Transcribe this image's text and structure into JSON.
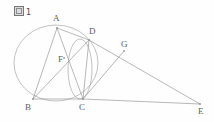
{
  "figure": {
    "caption_mark": "図",
    "caption_number": "1",
    "caption_full": "図 1"
  },
  "style": {
    "background": "#fefefe",
    "stroke": "#9a9a9a",
    "circle_stroke": "#a8a8a8",
    "label_color": "#5c5c5c"
  },
  "chart_data": {
    "type": "diagram",
    "points": [
      {
        "name": "A",
        "x": 57,
        "y": 28,
        "label_x": 53,
        "label_y": 14
      },
      {
        "name": "B",
        "x": 33,
        "y": 99,
        "label_x": 25,
        "label_y": 103
      },
      {
        "name": "C",
        "x": 83,
        "y": 99,
        "label_x": 79,
        "label_y": 103
      },
      {
        "name": "D",
        "x": 89,
        "y": 40,
        "label_x": 89,
        "label_y": 27
      },
      {
        "name": "E",
        "x": 200,
        "y": 104,
        "label_x": 198,
        "label_y": 107
      },
      {
        "name": "F",
        "x": 64,
        "y": 58,
        "label_x": 58,
        "label_y": 55
      },
      {
        "name": "G",
        "x": 124,
        "y": 51,
        "label_x": 121,
        "label_y": 40
      }
    ],
    "circles": [
      {
        "name": "circumcircle-ABCD",
        "cx": 56,
        "cy": 63,
        "rx": 42,
        "ry": 38,
        "rotation": 0
      },
      {
        "name": "inner-arc-DC",
        "cx": 80,
        "cy": 69,
        "rx": 12,
        "ry": 30,
        "rotation": 0
      }
    ],
    "segments": [
      {
        "name": "AB",
        "from": "A",
        "to": "B"
      },
      {
        "name": "AC",
        "from": "A",
        "to": "C"
      },
      {
        "name": "AD",
        "from": "A",
        "to": "D"
      },
      {
        "name": "BD",
        "from": "B",
        "to": "D"
      },
      {
        "name": "BC",
        "from": "B",
        "to": "C"
      },
      {
        "name": "CD",
        "from": "C",
        "to": "D"
      },
      {
        "name": "CE",
        "from": "C",
        "to": "E"
      },
      {
        "name": "CG",
        "from": "C",
        "to": "G"
      },
      {
        "name": "DE",
        "from": "D",
        "to": "E"
      }
    ]
  }
}
